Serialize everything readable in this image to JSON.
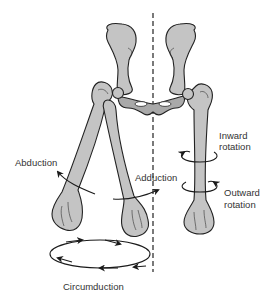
{
  "figure": {
    "labels": {
      "abduction": "Abduction",
      "adduction": "Adduction",
      "inward_rotation_line1": "Inward",
      "inward_rotation_line2": "rotation",
      "outward_rotation_line1": "Outward",
      "outward_rotation_line2": "rotation",
      "circumduction": "Circumduction"
    },
    "colors": {
      "bone_fill": "#c4c4c4",
      "bone_shadow": "#a9a9a9",
      "outline": "#222222",
      "text": "#333333",
      "background": "#ffffff"
    }
  }
}
